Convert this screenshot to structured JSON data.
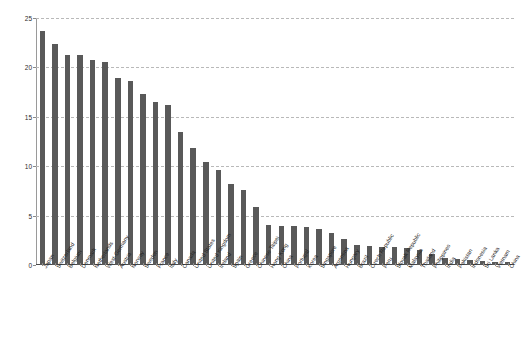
{
  "chart": {
    "title": "",
    "y_axis_label": "",
    "x_axis_label": ""
  },
  "chart_data": {
    "type": "bar",
    "title": "",
    "xlabel": "",
    "ylabel": "",
    "ylim": [
      0,
      25
    ],
    "yticks": [
      0,
      5,
      10,
      15,
      20,
      25
    ],
    "grid": true,
    "legend": false,
    "bar_color": "#595959",
    "categories": [
      "Japan",
      "Switzerland",
      "Belgium",
      "Denmark",
      "Netherlands",
      "West-Germany",
      "Austria",
      "Norway",
      "Sweden",
      "France",
      "Italy",
      "Canada",
      "United States",
      "United Kingdom",
      "Ireland",
      "Spain",
      "Greece",
      "Chinese Taipei",
      "Hong Kong",
      "China",
      "Portugal",
      "Korea",
      "Singapore",
      "Argentina",
      "Hungary",
      "Brazil",
      "Czech Republic",
      "Peru",
      "Slovak Republic",
      "Malaysia",
      "Thailand",
      "Philippines",
      "India",
      "Pakistan",
      "Indonesia",
      "Sri Lanka",
      "Vietnam",
      "China"
    ],
    "values": [
      23.7,
      22.4,
      21.3,
      21.3,
      20.8,
      20.5,
      18.9,
      18.6,
      17.3,
      16.5,
      16.2,
      13.5,
      11.8,
      10.4,
      9.6,
      8.2,
      7.6,
      5.9,
      4.0,
      3.9,
      3.9,
      3.8,
      3.6,
      3.2,
      2.6,
      2.0,
      1.9,
      1.8,
      1.8,
      1.7,
      1.5,
      1.1,
      0.7,
      0.6,
      0.5,
      0.4,
      0.35,
      0.3
    ]
  }
}
